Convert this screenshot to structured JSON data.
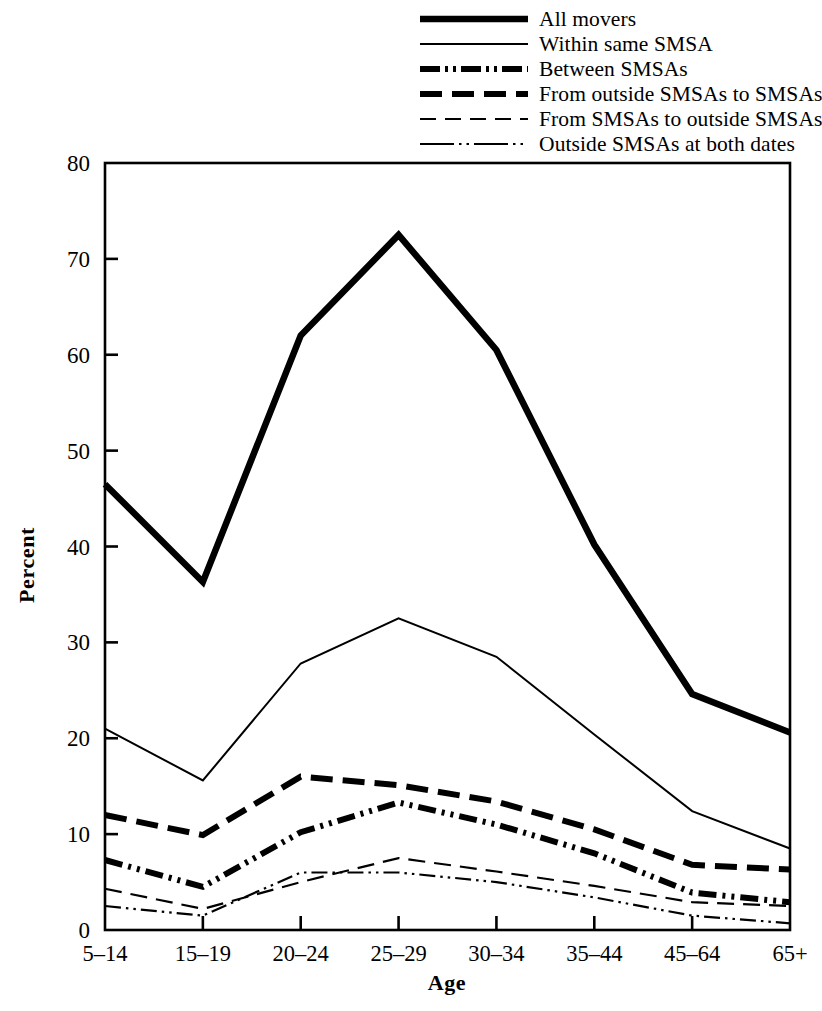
{
  "chart_data": {
    "type": "line",
    "title": "",
    "xlabel": "Age",
    "ylabel": "Percent",
    "categories": [
      "5–14",
      "15–19",
      "20–24",
      "25–29",
      "30–34",
      "35–44",
      "45–64",
      "65+"
    ],
    "ylim": [
      0,
      80
    ],
    "yticks": [
      0,
      10,
      20,
      30,
      40,
      50,
      60,
      70,
      80
    ],
    "ytick_labels": [
      "0",
      "10",
      "20",
      "30",
      "40",
      "50",
      "60",
      "70",
      "80"
    ],
    "grid": false,
    "legend_position": "top-center",
    "series": [
      {
        "name": "All movers",
        "style": "thick-solid",
        "stroke_width": 6.5,
        "dash": "none",
        "values": [
          46.5,
          36.3,
          62.0,
          72.5,
          60.5,
          40.2,
          24.6,
          20.6
        ]
      },
      {
        "name": "Within same SMSA",
        "style": "thin-solid",
        "stroke_width": 2.0,
        "dash": "none",
        "values": [
          21.0,
          15.6,
          27.8,
          32.5,
          28.5,
          20.4,
          12.4,
          8.5
        ]
      },
      {
        "name": "Between SMSAs",
        "style": "thick-dash-dot-dot",
        "stroke_width": 6.0,
        "dash": "18 6 3 6 3 6",
        "values": [
          7.3,
          4.5,
          10.2,
          13.3,
          11.0,
          8.0,
          3.9,
          2.9
        ]
      },
      {
        "name": "From outside SMSAs to SMSAs",
        "style": "thick-dashed",
        "stroke_width": 6.0,
        "dash": "22 10",
        "values": [
          12.0,
          9.9,
          16.0,
          15.1,
          13.4,
          10.5,
          6.8,
          6.3
        ]
      },
      {
        "name": "From SMSAs to outside SMSAs",
        "style": "thin-dashed",
        "stroke_width": 2.2,
        "dash": "17 9",
        "values": [
          4.3,
          2.2,
          5.0,
          7.5,
          6.1,
          4.6,
          2.9,
          2.5
        ]
      },
      {
        "name": "Outside SMSAs at both dates",
        "style": "thin-dash-dot-dot",
        "stroke_width": 2.2,
        "dash": "16 5 2.5 5 2.5 5",
        "values": [
          2.5,
          1.5,
          6.0,
          6.0,
          5.0,
          3.4,
          1.5,
          0.7
        ]
      }
    ]
  },
  "legend": {
    "items": [
      {
        "label": "All movers"
      },
      {
        "label": "Within same SMSA"
      },
      {
        "label": "Between SMSAs"
      },
      {
        "label": "From outside SMSAs to SMSAs"
      },
      {
        "label": "From SMSAs to outside SMSAs"
      },
      {
        "label": "Outside SMSAs at both dates"
      }
    ]
  },
  "axes": {
    "y_title": "Percent",
    "x_title": "Age"
  }
}
